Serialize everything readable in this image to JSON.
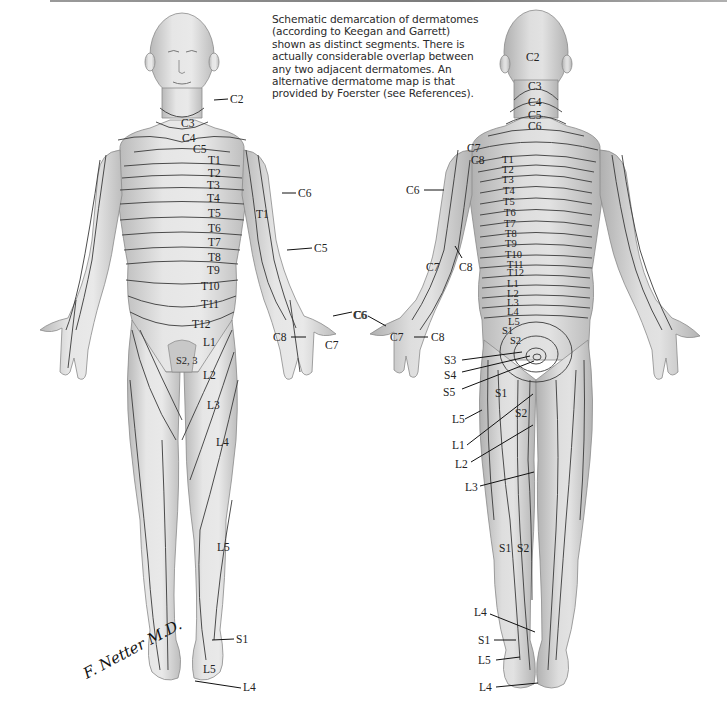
{
  "caption": {
    "lines": [
      "Schematic demarcation of dermatomes",
      "(according to Keegan and Garrett)",
      "shown as distinct segments. There is",
      "actually considerable overlap between",
      "any two adjacent dermatomes. An",
      "alternative dermatome map is that",
      "provided by Foerster (see References)."
    ]
  },
  "signature": "F. Netter M.D.",
  "anterior_view": {
    "labels": {
      "c2": "C2",
      "c3": "C3",
      "c4": "C4",
      "c5_neck": "C5",
      "t1": "T1",
      "t2": "T2",
      "t3": "T3",
      "t4": "T4",
      "t5": "T5",
      "t6": "T6",
      "t7": "T7",
      "t8": "T8",
      "t9": "T9",
      "t10": "T10",
      "t11": "T11",
      "t12": "T12",
      "t1_arm": "T1",
      "c6_arm": "C6",
      "c5_arm": "C5",
      "c6_hand": "C6",
      "c8_hand": "C8",
      "c7_hand": "C7",
      "l1": "L1",
      "s23": "S2, 3",
      "l2": "L2",
      "l3": "L3",
      "l4": "L4",
      "l5": "L5",
      "s1_foot": "S1",
      "l5_foot": "L5",
      "l4_foot": "L4"
    }
  },
  "posterior_view": {
    "labels": {
      "c2": "C2",
      "c3": "C3",
      "c4": "C4",
      "c5": "C5",
      "c6": "C6",
      "c7": "C7",
      "c8": "C8",
      "t1": "T1",
      "t2": "T2",
      "t3": "T3",
      "t4": "T4",
      "t5": "T5",
      "t6": "T6",
      "t7": "T7",
      "t8": "T8",
      "t9": "T9",
      "t10": "T10",
      "t11": "T11",
      "t12": "T12",
      "l1": "L1",
      "l2": "L2",
      "l3": "L3",
      "l4": "L4",
      "l5": "L5",
      "s1": "S1",
      "s2": "S2",
      "c6_arm": "C6",
      "c7_arm": "C7",
      "c8_arm": "C8",
      "c6_hand": "C6",
      "c7_hand": "C7",
      "c8_hand": "C8",
      "s3_lead": "S3",
      "s4_lead": "S4",
      "s5_lead": "S5",
      "s1_thigh": "S1",
      "s2_thigh": "S2",
      "l5_lead": "L5",
      "l1_lead": "L1",
      "l2_lead": "L2",
      "l3_lead": "L3",
      "s1_calf": "S1",
      "s2_calf": "S2",
      "l4_ankle": "L4",
      "s1_ankle": "S1",
      "l5_ankle": "L5",
      "l4_sole": "L4"
    }
  }
}
